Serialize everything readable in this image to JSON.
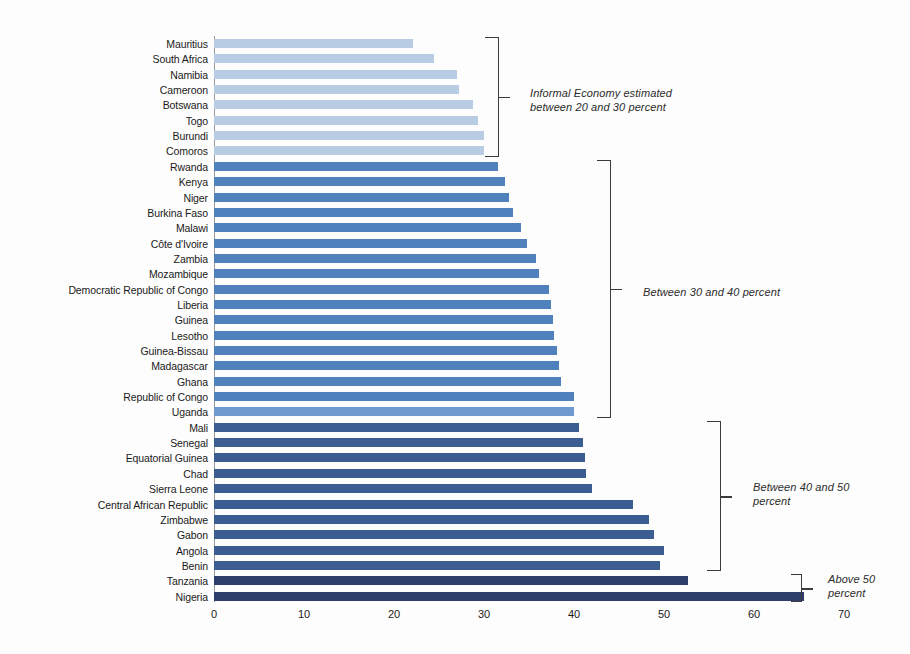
{
  "chart_data": {
    "type": "bar",
    "orientation": "horizontal",
    "title": "",
    "subtitle": "",
    "xlabel": "",
    "ylabel": "",
    "xlim": [
      0,
      70
    ],
    "xticks": [
      0,
      10,
      20,
      30,
      40,
      50,
      60,
      70
    ],
    "xtick_labels": [
      "0",
      "10",
      "20",
      "30",
      "40",
      "50",
      "60",
      "70"
    ],
    "grid": false,
    "legend": "none",
    "categories": [
      "Mauritius",
      "South Africa",
      "Namibia",
      "Cameroon",
      "Botswana",
      "Togo",
      "Burundi",
      "Comoros",
      "Rwanda",
      "Kenya",
      "Niger",
      "Burkina Faso",
      "Malawi",
      "Côte d'Ivoire",
      "Zambia",
      "Mozambique",
      "Democratic Republic of Congo",
      "Liberia",
      "Guinea",
      "Lesotho",
      "Guinea-Bissau",
      "Madagascar",
      "Ghana",
      "Republic of Congo",
      "Uganda",
      "Mali",
      "Senegal",
      "Equatorial Guinea",
      "Chad",
      "Sierra Leone",
      "Central African Republic",
      "Zimbabwe",
      "Gabon",
      "Angola",
      "Benin",
      "Tanzania",
      "Nigeria"
    ],
    "values": [
      22.1,
      24.4,
      27.0,
      27.2,
      28.8,
      29.3,
      30.0,
      30.0,
      31.6,
      32.3,
      32.8,
      33.2,
      34.1,
      34.8,
      35.8,
      36.1,
      37.2,
      37.4,
      37.7,
      37.8,
      38.1,
      38.3,
      38.5,
      40.0,
      40.0,
      40.5,
      41.0,
      41.2,
      41.3,
      42.0,
      46.5,
      48.3,
      48.9,
      50.0,
      49.6,
      52.7,
      65.5
    ],
    "colors": [
      "#b8cce4",
      "#b8cce4",
      "#b8cce4",
      "#b8cce4",
      "#b8cce4",
      "#b8cce4",
      "#b8cce4",
      "#b8cce4",
      "#4f81bd",
      "#4f81bd",
      "#4f81bd",
      "#4f81bd",
      "#4f81bd",
      "#4f81bd",
      "#4f81bd",
      "#4f81bd",
      "#4f81bd",
      "#4f81bd",
      "#4f81bd",
      "#4f81bd",
      "#4f81bd",
      "#4f81bd",
      "#4f81bd",
      "#4f81bd",
      "#6f9ad0",
      "#3c5d92",
      "#3c5d92",
      "#3c5d92",
      "#3c5d92",
      "#3c5d92",
      "#3c5d92",
      "#3c5d92",
      "#3c5d92",
      "#3c5d92",
      "#3c5d92",
      "#2e3f6b",
      "#2e3f6b"
    ],
    "annotations": [
      {
        "id": "group-20-30",
        "text": "Informal Economy estimated\nbetween 20 and 30 percent",
        "range": "20 to 30 percent",
        "first_category": "Mauritius",
        "last_category": "Comoros"
      },
      {
        "id": "group-30-40",
        "text": "Between 30 and 40 percent",
        "range": "30 to 40 percent",
        "first_category": "Rwanda",
        "last_category": "Uganda"
      },
      {
        "id": "group-40-50",
        "text": "Between 40 and 50\npercent",
        "range": "40 to 50 percent",
        "first_category": "Mali",
        "last_category": "Benin"
      },
      {
        "id": "group-above-50",
        "text": "Above 50\npercent",
        "range": "above 50 percent",
        "first_category": "Tanzania",
        "last_category": "Nigeria"
      }
    ]
  },
  "accent_colors": {
    "light_blue": "#b8cce4",
    "medium_blue": "#4f81bd",
    "dark_blue": "#3c5d92",
    "navy": "#2e3f6b",
    "axis": "#9a9a9a",
    "bracket": "#3b3b3b"
  }
}
